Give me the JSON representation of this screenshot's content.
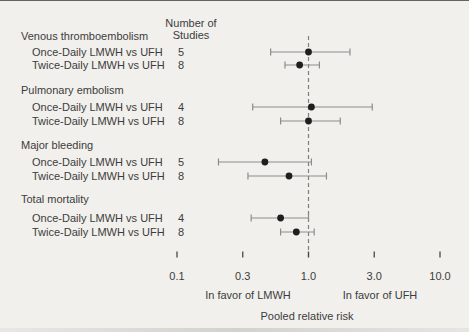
{
  "chart_data": {
    "type": "forest",
    "column_header": [
      "Number of",
      "Studies"
    ],
    "xlabel": "Pooled relative risk",
    "x_scale": "log",
    "x_ticks": [
      0.1,
      0.3,
      1.0,
      3.0,
      10.0
    ],
    "x_tick_labels": [
      "0.1",
      "0.3",
      "1.0",
      "3.0",
      "10.0"
    ],
    "xlim": [
      0.1,
      10.0
    ],
    "reference_line": 1.0,
    "left_annotation": "In favor of LMWH",
    "right_annotation": "In favor of UFH",
    "groups": [
      {
        "label": "Venous thromboembolism",
        "rows": [
          {
            "label": "Once-Daily LMWH vs UFH",
            "n_studies": "5",
            "rr": 1.0,
            "ci_low": 0.5,
            "ci_high": 2.0
          },
          {
            "label": "Twice-Daily LMWH vs UFH",
            "n_studies": "8",
            "rr": 0.85,
            "ci_low": 0.65,
            "ci_high": 1.2
          }
        ]
      },
      {
        "label": "Pulmonary embolism",
        "rows": [
          {
            "label": "Once-Daily LMWH vs UFH",
            "n_studies": "4",
            "rr": 1.05,
            "ci_low": 0.36,
            "ci_high": 2.9
          },
          {
            "label": "Twice-Daily LMWH vs UFH",
            "n_studies": "8",
            "rr": 1.0,
            "ci_low": 0.6,
            "ci_high": 1.7
          }
        ]
      },
      {
        "label": "Major bleeding",
        "rows": [
          {
            "label": "Once-Daily LMWH vs UFH",
            "n_studies": "5",
            "rr": 0.45,
            "ci_low": 0.2,
            "ci_high": 1.05
          },
          {
            "label": "Twice-Daily LMWH vs UFH",
            "n_studies": "8",
            "rr": 0.7,
            "ci_low": 0.33,
            "ci_high": 1.35
          }
        ]
      },
      {
        "label": "Total mortality",
        "rows": [
          {
            "label": "Once-Daily LMWH vs UFH",
            "n_studies": "4",
            "rr": 0.6,
            "ci_low": 0.35,
            "ci_high": 1.0
          },
          {
            "label": "Twice-Daily LMWH vs UFH",
            "n_studies": "8",
            "rr": 0.8,
            "ci_low": 0.6,
            "ci_high": 1.1
          }
        ]
      }
    ],
    "colors": {
      "background": "#f1f0ec",
      "text": "#3c3c3c",
      "marker": "#1e1e1e",
      "whisker": "#8c8c8c",
      "reference_line": "#7f7f7f",
      "axis_left": "#52494e",
      "axis_mid": "#454545",
      "axis_right": "#416b4a",
      "tick": "#474747"
    }
  }
}
